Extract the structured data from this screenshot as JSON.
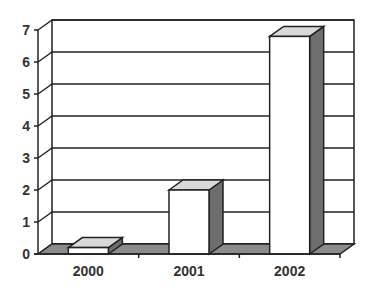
{
  "chart_data": {
    "type": "bar",
    "style": "3d-column",
    "title": "",
    "xlabel": "",
    "ylabel": "",
    "categories": [
      "2000",
      "2001",
      "2002"
    ],
    "values": [
      0.2,
      2,
      6.8
    ],
    "ylim": [
      0,
      7
    ],
    "yticks": [
      "0",
      "1",
      "2",
      "3",
      "4",
      "5",
      "6",
      "7"
    ],
    "grid": true,
    "legend": null
  },
  "colors": {
    "bar_front": "#ffffff",
    "bar_top": "#d9d9d9",
    "bar_side": "#6e6e6e",
    "floor": "#8c8c8c",
    "grid": "#222222",
    "text": "#333333"
  }
}
